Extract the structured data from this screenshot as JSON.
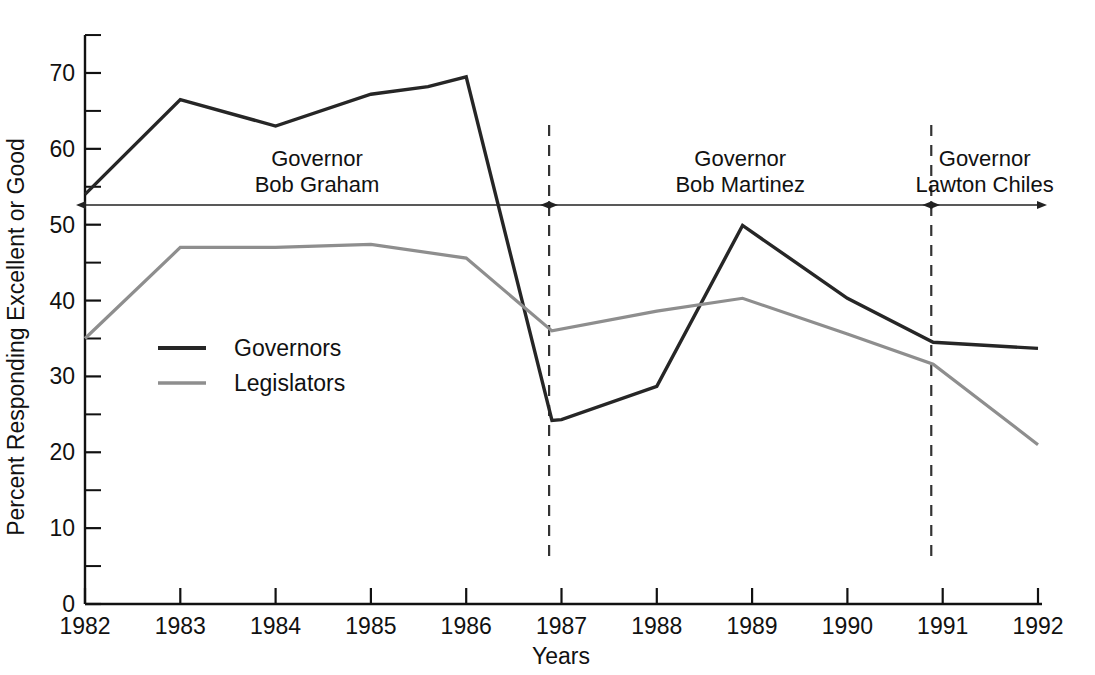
{
  "chart_data": {
    "type": "line",
    "title": "",
    "xlabel": "Years",
    "ylabel": "Percent Responding Excellent or Good",
    "x": [
      1982,
      1983,
      1984,
      1985,
      1986,
      1987,
      1988,
      1989,
      1990,
      1991,
      1992
    ],
    "xlim": [
      1982,
      1992
    ],
    "ylim": [
      0,
      75
    ],
    "yticks_major": [
      0,
      10,
      20,
      30,
      40,
      50,
      60,
      70
    ],
    "yticks_minor": [
      5,
      15,
      25,
      35,
      45,
      55,
      65,
      75
    ],
    "xtick_labels": [
      "1982",
      "1983",
      "1984",
      "1985",
      "1986",
      "1987",
      "1988",
      "1989",
      "1990",
      "1991",
      "1992"
    ],
    "grid": false,
    "legend_position": "inside-left",
    "series": [
      {
        "name": "Governors",
        "color": "#262626",
        "points": [
          {
            "x": 1982.0,
            "y": 54.0
          },
          {
            "x": 1983.0,
            "y": 66.5
          },
          {
            "x": 1984.0,
            "y": 63.0
          },
          {
            "x": 1985.0,
            "y": 67.2
          },
          {
            "x": 1985.6,
            "y": 68.2
          },
          {
            "x": 1986.0,
            "y": 69.5
          },
          {
            "x": 1986.9,
            "y": 24.2
          },
          {
            "x": 1987.0,
            "y": 24.3
          },
          {
            "x": 1988.0,
            "y": 28.7
          },
          {
            "x": 1988.9,
            "y": 49.9
          },
          {
            "x": 1990.0,
            "y": 40.3
          },
          {
            "x": 1990.9,
            "y": 34.5
          },
          {
            "x": 1992.0,
            "y": 33.7
          }
        ]
      },
      {
        "name": "Legislators",
        "color": "#8e8e8e",
        "points": [
          {
            "x": 1982.0,
            "y": 35.0
          },
          {
            "x": 1983.0,
            "y": 47.0
          },
          {
            "x": 1984.0,
            "y": 47.0
          },
          {
            "x": 1985.0,
            "y": 47.4
          },
          {
            "x": 1986.0,
            "y": 45.6
          },
          {
            "x": 1986.9,
            "y": 36.0
          },
          {
            "x": 1988.0,
            "y": 38.6
          },
          {
            "x": 1988.9,
            "y": 40.3
          },
          {
            "x": 1990.0,
            "y": 35.6
          },
          {
            "x": 1990.9,
            "y": 31.6
          },
          {
            "x": 1992.0,
            "y": 21.0
          }
        ]
      }
    ],
    "dividers": [
      {
        "x": 1986.87,
        "label": "term-boundary-graham-martinez"
      },
      {
        "x": 1990.88,
        "label": "term-boundary-martinez-chiles"
      }
    ],
    "annotations": [
      {
        "id": "term-graham",
        "line1": "Governor",
        "line2": "Bob Graham",
        "x_start": 1982.0,
        "x_end": 1986.87
      },
      {
        "id": "term-martinez",
        "line1": "Governor",
        "line2": "Bob Martinez",
        "x_start": 1986.87,
        "x_end": 1990.88
      },
      {
        "id": "term-chiles",
        "line1": "Governor",
        "line2": "Lawton Chiles",
        "x_start": 1990.88,
        "x_end": 1992.0
      }
    ]
  },
  "legend": {
    "items": [
      {
        "label": "Governors",
        "color": "#262626"
      },
      {
        "label": "Legislators",
        "color": "#8e8e8e"
      }
    ]
  }
}
